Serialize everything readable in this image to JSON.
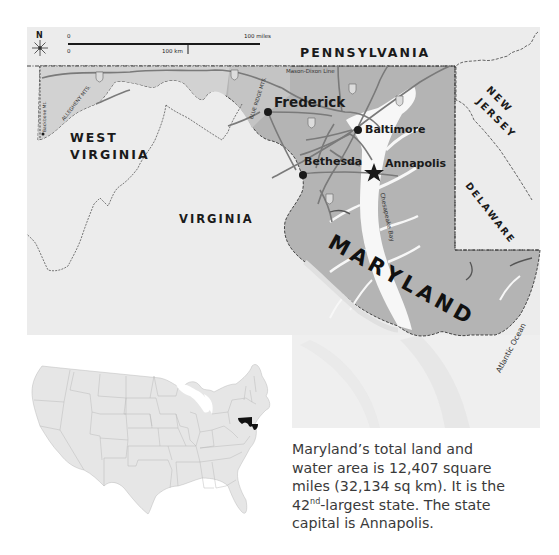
{
  "map": {
    "compass": {
      "label": "N",
      "icon": "compass-rose-icon"
    },
    "scale_bar": {
      "miles_zero": "0",
      "miles_label": "100 miles",
      "km_zero": "0",
      "km_label": "100 km"
    },
    "states": {
      "pennsylvania": "PENNSYLVANIA",
      "west_virginia_line1": "WEST",
      "west_virginia_line2": "VIRGINIA",
      "virginia": "VIRGINIA",
      "new_jersey_line1": "NEW",
      "new_jersey_line2": "JERSEY",
      "delaware": "DELAWARE",
      "maryland": "MARYLAND"
    },
    "features": {
      "mason_dixon": "Mason-Dixon Line",
      "allegheny": "ALLEGHENY MTS.",
      "blue_ridge": "BLUE RIDGE MTS.",
      "backbone": "Backbone Mt.",
      "chesapeake": "Chesapeake Bay",
      "atlantic": "Atlantic Ocean"
    },
    "cities": [
      {
        "name": "Frederick",
        "type": "city"
      },
      {
        "name": "Baltimore",
        "type": "city"
      },
      {
        "name": "Bethesda",
        "type": "city"
      },
      {
        "name": "Annapolis",
        "type": "capital"
      }
    ],
    "colors": {
      "maryland_fill": "#b4b4b4",
      "neighbor_fill": "#ececec",
      "water": "#f7f7f7",
      "road": "#7a7a7a",
      "border": "#333333",
      "highlight_state": "#111111"
    }
  },
  "inset": {
    "label": "United States locator map",
    "highlighted_state": "Maryland"
  },
  "caption": {
    "line1": "Maryland’s total land and",
    "line2": "water area is 12,407 square",
    "line3": "miles (32,134 sq km). It is the",
    "line4_pre": "42",
    "line4_sup": "nd",
    "line4_post": "-largest state. The state",
    "line5": "capital is Annapolis."
  }
}
